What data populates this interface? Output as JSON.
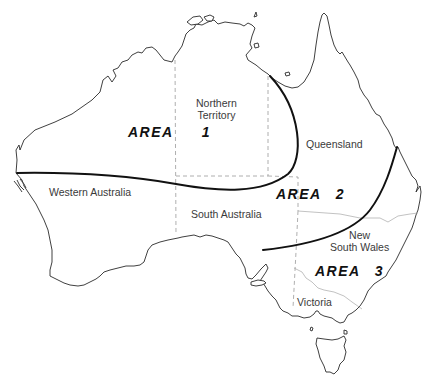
{
  "map": {
    "title": "Australia",
    "colors": {
      "coastline": "#2a2a2a",
      "state_border": "#9a9a9a",
      "area_boundary": "#111111",
      "label": "#3a3a3a"
    },
    "states": [
      {
        "id": "wa",
        "label": "Western Australia"
      },
      {
        "id": "nt",
        "label_line1": "Northern",
        "label_line2": "Territory"
      },
      {
        "id": "qld",
        "label": "Queensland"
      },
      {
        "id": "sa",
        "label": "South Australia"
      },
      {
        "id": "nsw",
        "label_line1": "New",
        "label_line2": "South Wales"
      },
      {
        "id": "vic",
        "label": "Victoria"
      }
    ],
    "areas": [
      {
        "id": "area1",
        "word": "AREA",
        "number": "1"
      },
      {
        "id": "area2",
        "word": "AREA",
        "number": "2"
      },
      {
        "id": "area3",
        "word": "AREA",
        "number": "3"
      }
    ]
  }
}
